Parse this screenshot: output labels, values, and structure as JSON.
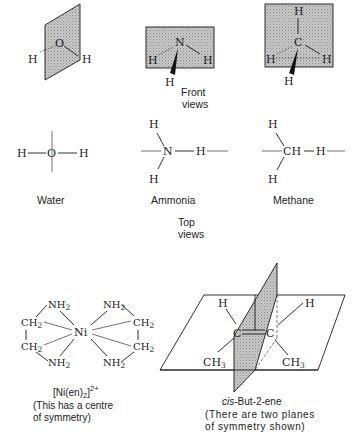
{
  "figure": {
    "front_views": {
      "caption_line1": "Front",
      "caption_line2": "views",
      "water": {
        "center": "O",
        "h_left": "H",
        "h_right": "H"
      },
      "ammonia": {
        "center": "N",
        "h_left": "H",
        "h_right": "H",
        "h_wedge": "H"
      },
      "methane": {
        "center": "C",
        "h_top": "H",
        "h_left": "H",
        "h_right": "H",
        "h_wedge": "H"
      }
    },
    "top_views": {
      "caption_line1": "Top",
      "caption_line2": "views",
      "water": {
        "h_left": "H",
        "center": "O",
        "h_right": "H",
        "label": "Water"
      },
      "ammonia": {
        "h_top": "H",
        "center": "N",
        "h_right": "H",
        "h_bottom": "H",
        "label": "Ammonia"
      },
      "methane": {
        "h_top": "H",
        "center": "CH",
        "h_right": "H",
        "h_bottom": "H",
        "label": "Methane"
      }
    },
    "nickel_complex": {
      "metal": "Ni",
      "nh2": "NH",
      "ch2": "CH",
      "subscript": "2",
      "formula_main": "[Ni(en)",
      "formula_sub": "2",
      "formula_close": "]",
      "formula_charge": "2+",
      "note_line1": "(This has a centre",
      "note_line2": "of symmetry)"
    },
    "butene": {
      "h_left": "H",
      "h_right": "H",
      "c_left": "C",
      "c_right": "C",
      "ch3": "CH",
      "ch3_sub": "3",
      "name_italic": "cis",
      "name_rest": "-But-2-ene",
      "note_line1": "(There are two planes",
      "note_line2": "of symmetry shown)"
    }
  }
}
